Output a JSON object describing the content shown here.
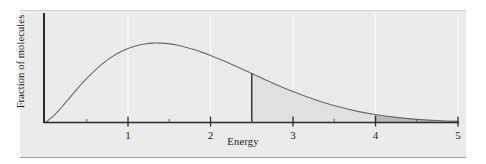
{
  "chart_data": {
    "type": "area",
    "title": "",
    "xlabel": "Energy",
    "ylabel": "Fraction of molecules",
    "xlim": [
      0,
      5
    ],
    "ylim": [
      0,
      1.05
    ],
    "grid": true,
    "legend": "none",
    "xticks": [
      1,
      2,
      3,
      4,
      5
    ],
    "xtick_labels": [
      "1",
      "2",
      "3",
      "4",
      "5"
    ],
    "xminorticks": [
      0.5,
      1.5,
      2.5,
      3.5,
      4.5
    ],
    "yticks": [],
    "ytick_labels": [],
    "series": [
      {
        "name": "Maxwell-Boltzmann distribution",
        "x": [
          0.0,
          0.1,
          0.2,
          0.3,
          0.4,
          0.5,
          0.6,
          0.7,
          0.8,
          0.9,
          1.0,
          1.1,
          1.2,
          1.3,
          1.4,
          1.5,
          1.6,
          1.7,
          1.8,
          1.9,
          2.0,
          2.2,
          2.4,
          2.5,
          2.6,
          2.8,
          3.0,
          3.2,
          3.4,
          3.6,
          3.8,
          4.0,
          4.2,
          4.4,
          4.6,
          4.8,
          5.0
        ],
        "y": [
          0.0,
          0.069,
          0.159,
          0.257,
          0.354,
          0.445,
          0.527,
          0.599,
          0.66,
          0.709,
          0.747,
          0.775,
          0.793,
          0.801,
          0.801,
          0.794,
          0.78,
          0.76,
          0.736,
          0.708,
          0.677,
          0.608,
          0.533,
          0.495,
          0.457,
          0.382,
          0.312,
          0.249,
          0.194,
          0.148,
          0.11,
          0.08,
          0.057,
          0.039,
          0.026,
          0.017,
          0.011
        ]
      }
    ],
    "shaded_regions": [
      {
        "name": "light-shaded-region",
        "from": 2.5,
        "to": 5.0,
        "color": "#e0e0e0",
        "boundary_line_x": 2.5,
        "boundary_line_color": "#2b2b2b"
      },
      {
        "name": "dark-shaded-region",
        "from": 4.0,
        "to": 5.0,
        "color": "#b9b9b9",
        "boundary_line_x": 4.0,
        "boundary_line_color": "#6e6e6e"
      }
    ],
    "curve_color": "#6a6a6a",
    "axis_color": "#2b2b2b",
    "gridline_color": "#fbfbfb",
    "panel_background": "#ebebeb",
    "peak": {
      "x": 1.3,
      "y": 0.801
    }
  }
}
